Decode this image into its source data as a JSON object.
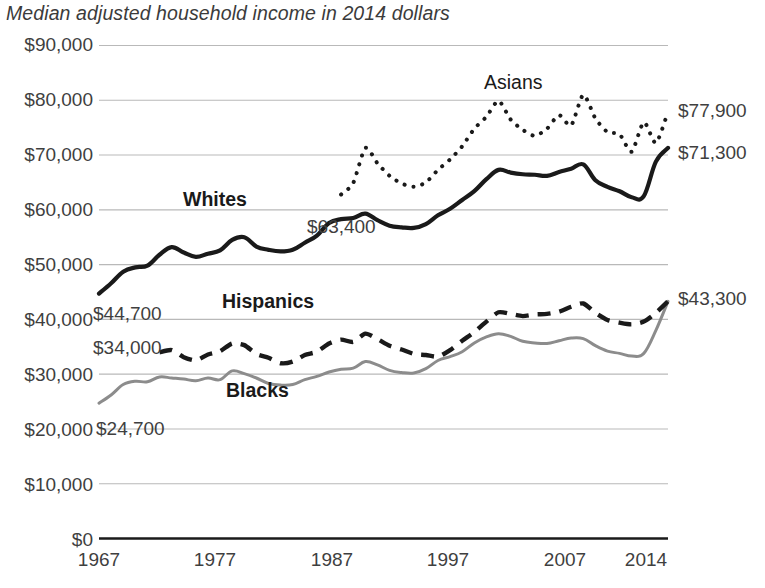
{
  "chart_data": {
    "type": "line",
    "title": "Median adjusted household income in 2014 dollars",
    "xlabel": "",
    "ylabel": "",
    "grid": true,
    "legend_position": "inline-labels",
    "xlim": [
      1967,
      2014
    ],
    "ylim": [
      0,
      90000
    ],
    "yticks": [
      "$0",
      "$10,000",
      "$20,000",
      "$30,000",
      "$40,000",
      "$50,000",
      "$60,000",
      "$70,000",
      "$80,000",
      "$90,000"
    ],
    "ytick_values": [
      0,
      10000,
      20000,
      30000,
      40000,
      50000,
      60000,
      70000,
      80000,
      90000
    ],
    "xticks": [
      "1967",
      "1977",
      "1987",
      "1997",
      "2007",
      "2014"
    ],
    "xtick_values": [
      1967,
      1977,
      1987,
      1997,
      2007,
      2014
    ],
    "annotations": [
      {
        "text": "$44,700",
        "series": "Whites",
        "side": "left",
        "value": 44700
      },
      {
        "text": "$34,000",
        "series": "Hispanics",
        "side": "left",
        "value": 34000
      },
      {
        "text": "$24,700",
        "series": "Blacks",
        "side": "left",
        "value": 24700
      },
      {
        "text": "$63,400",
        "series": "Whites",
        "side": "mid",
        "value": 63400
      },
      {
        "text": "$77,900",
        "series": "Asians",
        "side": "right",
        "value": 77900
      },
      {
        "text": "$71,300",
        "series": "Whites",
        "side": "right",
        "value": 71300
      },
      {
        "text": "$43,300",
        "series": "Hispanics/Blacks",
        "side": "right",
        "value": 43300
      }
    ],
    "series": [
      {
        "name": "Asians",
        "label": "Asians",
        "style": "dotted",
        "color": "#1a1a1a",
        "x": [
          1987,
          1988,
          1989,
          1990,
          1991,
          1992,
          1993,
          1994,
          1995,
          1996,
          1997,
          1998,
          1999,
          2000,
          2001,
          2002,
          2003,
          2004,
          2005,
          2006,
          2007,
          2008,
          2009,
          2010,
          2011,
          2012,
          2013,
          2014
        ],
        "values": [
          62800,
          64900,
          71300,
          68500,
          66200,
          64800,
          64200,
          65000,
          67300,
          69200,
          71600,
          74800,
          77000,
          79900,
          76500,
          74600,
          73500,
          74800,
          77300,
          75400,
          81000,
          76700,
          74200,
          73800,
          70600,
          76000,
          72200,
          77900
        ]
      },
      {
        "name": "Whites",
        "label": "Whites",
        "style": "solid-thick",
        "color": "#1a1a1a",
        "x": [
          1967,
          1968,
          1969,
          1970,
          1971,
          1972,
          1973,
          1974,
          1975,
          1976,
          1977,
          1978,
          1979,
          1980,
          1981,
          1982,
          1983,
          1984,
          1985,
          1986,
          1987,
          1988,
          1989,
          1990,
          1991,
          1992,
          1993,
          1994,
          1995,
          1996,
          1997,
          1998,
          1999,
          2000,
          2001,
          2002,
          2003,
          2004,
          2005,
          2006,
          2007,
          2008,
          2009,
          2010,
          2011,
          2012,
          2013,
          2014
        ],
        "values": [
          44700,
          46600,
          48700,
          49500,
          49800,
          51800,
          53200,
          52200,
          51400,
          52000,
          52600,
          54500,
          55000,
          53300,
          52700,
          52400,
          52700,
          54000,
          55300,
          57600,
          58300,
          58500,
          59300,
          58100,
          57100,
          56800,
          56700,
          57400,
          59000,
          60200,
          61800,
          63400,
          65600,
          67300,
          66800,
          66500,
          66400,
          66200,
          66900,
          67500,
          68300,
          65400,
          64200,
          63400,
          62300,
          62500,
          68800,
          71300
        ]
      },
      {
        "name": "Hispanics",
        "label": "Hispanics",
        "style": "dashed-thick",
        "color": "#1a1a1a",
        "x": [
          1972,
          1973,
          1974,
          1975,
          1976,
          1977,
          1978,
          1979,
          1980,
          1981,
          1982,
          1983,
          1984,
          1985,
          1986,
          1987,
          1988,
          1989,
          1990,
          1991,
          1992,
          1993,
          1994,
          1995,
          1996,
          1997,
          1998,
          1999,
          2000,
          2001,
          2002,
          2003,
          2004,
          2005,
          2006,
          2007,
          2008,
          2009,
          2010,
          2011,
          2012,
          2013,
          2014
        ],
        "values": [
          34000,
          34400,
          33100,
          32500,
          33600,
          34200,
          35600,
          35300,
          33700,
          33000,
          32000,
          32300,
          33500,
          34100,
          35600,
          36300,
          35900,
          37400,
          36400,
          35200,
          34500,
          33700,
          33500,
          33200,
          34400,
          36100,
          37700,
          39600,
          41300,
          41000,
          40600,
          40900,
          41000,
          41400,
          42300,
          42900,
          41200,
          39900,
          39400,
          39100,
          39600,
          41200,
          43300
        ]
      },
      {
        "name": "Blacks",
        "label": "Blacks",
        "style": "solid-gray",
        "color": "#8c8c8c",
        "x": [
          1967,
          1968,
          1969,
          1970,
          1971,
          1972,
          1973,
          1974,
          1975,
          1976,
          1977,
          1978,
          1979,
          1980,
          1981,
          1982,
          1983,
          1984,
          1985,
          1986,
          1987,
          1988,
          1989,
          1990,
          1991,
          1992,
          1993,
          1994,
          1995,
          1996,
          1997,
          1998,
          1999,
          2000,
          2001,
          2002,
          2003,
          2004,
          2005,
          2006,
          2007,
          2008,
          2009,
          2010,
          2011,
          2012,
          2013,
          2014
        ],
        "values": [
          24700,
          26200,
          28100,
          28700,
          28600,
          29500,
          29300,
          29100,
          28800,
          29300,
          29000,
          30600,
          30100,
          29300,
          28300,
          28000,
          28100,
          29000,
          29600,
          30400,
          30900,
          31100,
          32300,
          31700,
          30700,
          30300,
          30200,
          31000,
          32500,
          33200,
          34100,
          35700,
          36800,
          37400,
          36900,
          36000,
          35700,
          35600,
          36100,
          36600,
          36500,
          35200,
          34200,
          33800,
          33300,
          33800,
          38000,
          43300
        ]
      }
    ]
  },
  "axis": {
    "yticks": [
      {
        "label": "$90,000",
        "value": 90000
      },
      {
        "label": "$80,000",
        "value": 80000
      },
      {
        "label": "$70,000",
        "value": 70000
      },
      {
        "label": "$60,000",
        "value": 60000
      },
      {
        "label": "$50,000",
        "value": 50000
      },
      {
        "label": "$40,000",
        "value": 40000
      },
      {
        "label": "$30,000",
        "value": 30000
      },
      {
        "label": "$20,000",
        "value": 20000
      },
      {
        "label": "$10,000",
        "value": 10000
      },
      {
        "label": "$0",
        "value": 0
      }
    ],
    "xticks": [
      {
        "label": "1967",
        "value": 1967
      },
      {
        "label": "1977",
        "value": 1977
      },
      {
        "label": "1987",
        "value": 1987
      },
      {
        "label": "1997",
        "value": 1997
      },
      {
        "label": "2007",
        "value": 2007
      },
      {
        "label": "2014",
        "value": 2014
      }
    ]
  },
  "labels": {
    "asians": "Asians",
    "whites": "Whites",
    "hispanics": "Hispanics",
    "blacks": "Blacks",
    "start_whites": "$44,700",
    "start_hispanics": "$34,000",
    "start_blacks": "$24,700",
    "mid_whites": "$63,400",
    "end_asians": "$77,900",
    "end_whites": "$71,300",
    "end_hisp_black": "$43,300"
  },
  "colors": {
    "ink": "#1a1a1a",
    "gray_series": "#8c8c8c",
    "grid": "#b9b9b9",
    "text": "#3f3f3f"
  }
}
